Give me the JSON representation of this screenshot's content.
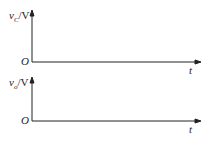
{
  "diagram": {
    "top_axes": {
      "y_label_var": "v",
      "y_label_sub": "C",
      "y_label_unit": "/V",
      "origin": "O",
      "x_label": "t"
    },
    "bottom_axes": {
      "y_label_var": "v",
      "y_label_sub": "o",
      "y_label_unit": "/V",
      "origin": "O",
      "x_label": "t"
    },
    "colors": {
      "axis": "#222222"
    }
  }
}
